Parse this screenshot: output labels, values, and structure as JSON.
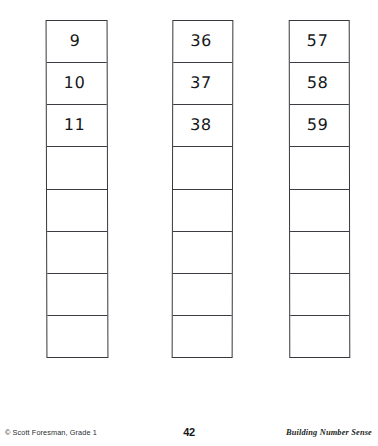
{
  "page": {
    "background_color": "#ffffff",
    "ink_color": "#16181a",
    "border_color": "#35383c"
  },
  "worksheet": {
    "strips": [
      {
        "name": "strip-1",
        "left": 46,
        "top": 20,
        "width": 62,
        "height": 338,
        "cells": [
          {
            "value": "9",
            "filled": true
          },
          {
            "value": "10",
            "filled": true
          },
          {
            "value": "11",
            "filled": true
          },
          {
            "value": "",
            "filled": false
          },
          {
            "value": "",
            "filled": false
          },
          {
            "value": "",
            "filled": false
          },
          {
            "value": "",
            "filled": false
          },
          {
            "value": "",
            "filled": false
          }
        ]
      },
      {
        "name": "strip-2",
        "left": 172,
        "top": 20,
        "width": 61,
        "height": 338,
        "cells": [
          {
            "value": "36",
            "filled": true
          },
          {
            "value": "37",
            "filled": true
          },
          {
            "value": "38",
            "filled": true
          },
          {
            "value": "",
            "filled": false
          },
          {
            "value": "",
            "filled": false
          },
          {
            "value": "",
            "filled": false
          },
          {
            "value": "",
            "filled": false
          },
          {
            "value": "",
            "filled": false
          }
        ]
      },
      {
        "name": "strip-3",
        "left": 289,
        "top": 20,
        "width": 61,
        "height": 338,
        "cells": [
          {
            "value": "57",
            "filled": true
          },
          {
            "value": "58",
            "filled": true
          },
          {
            "value": "59",
            "filled": true
          },
          {
            "value": "",
            "filled": false
          },
          {
            "value": "",
            "filled": false
          },
          {
            "value": "",
            "filled": false
          },
          {
            "value": "",
            "filled": false
          },
          {
            "value": "",
            "filled": false
          }
        ]
      }
    ]
  },
  "footer": {
    "credit": "© Scott Foresman, Grade 1",
    "page_number": "42",
    "series": "Building Number Sense"
  }
}
